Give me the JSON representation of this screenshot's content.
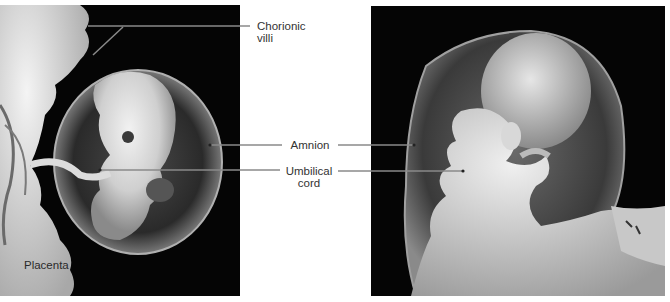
{
  "figure": {
    "panels": [
      {
        "id": "left",
        "description": "Embryo within amnion attached to placenta"
      },
      {
        "id": "right",
        "description": "Later-stage fetus within amnion"
      }
    ],
    "labels": {
      "chorionic_villi_line1": "Chorionic",
      "chorionic_villi_line2": "villi",
      "amnion": "Amnion",
      "umbilical_line1": "Umbilical",
      "umbilical_line2": "cord",
      "placenta": "Placenta"
    },
    "colors": {
      "background": "#ffffff",
      "photo_background": "#050505",
      "label_text": "#333333",
      "leader_line": "#8a8a8a"
    }
  }
}
